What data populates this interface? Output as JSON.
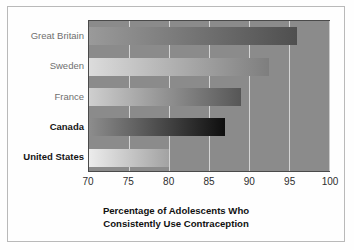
{
  "chart_data": {
    "type": "bar",
    "orientation": "horizontal",
    "title_lines": [
      "Percentage of Adolescents Who",
      "Consistently Use Contraception"
    ],
    "xlabel": "",
    "ylabel": "",
    "xlim": [
      70,
      100
    ],
    "xticks": [
      70,
      75,
      80,
      85,
      90,
      95,
      100
    ],
    "xtick_labels": [
      "70",
      "75",
      "80",
      "85",
      "90",
      "95",
      "100"
    ],
    "grid": true,
    "grid_axis": "x",
    "legend": false,
    "categories": [
      "Great Britain",
      "Sweden",
      "France",
      "Canada",
      "United States"
    ],
    "values": [
      96,
      92.5,
      89,
      87,
      80
    ],
    "bars": [
      {
        "label": "Great Britain",
        "value": 96,
        "emphasis": false,
        "fill_start": "#9a9a9a",
        "fill_end": "#4f4f4f"
      },
      {
        "label": "Sweden",
        "value": 92.5,
        "emphasis": false,
        "fill_start": "#dcdcdc",
        "fill_end": "#7e7e7e"
      },
      {
        "label": "France",
        "value": 89,
        "emphasis": false,
        "fill_start": "#cfcfcf",
        "fill_end": "#565656"
      },
      {
        "label": "Canada",
        "value": 87,
        "emphasis": true,
        "fill_start": "#8d8d8d",
        "fill_end": "#0e0e0e"
      },
      {
        "label": "United States",
        "value": 80,
        "emphasis": true,
        "fill_start": "#ececec",
        "fill_end": "#a2a2a2"
      }
    ],
    "plot_background": "#8b8b8b",
    "gridline_color": "#e2e2e2",
    "border_color": "#4a4a4a"
  }
}
